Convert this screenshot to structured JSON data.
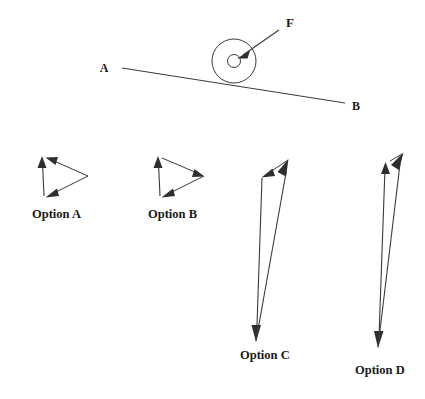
{
  "figure": {
    "title_present": false,
    "background_color": "#ffffff",
    "ink_color": "#3a3a3a",
    "arrow_fill_color": "#2e2e2e",
    "scene": {
      "name": "wheel-on-incline",
      "description": "A wheel with a central hub resting on an inclined line from A (upper left) to B (lower right), with an applied force F directed down-and-left into the hub.",
      "incline": {
        "left_point_label": "A",
        "right_point_label": "B",
        "left_end": {
          "x": 122,
          "y": 68
        },
        "right_end": {
          "x": 345,
          "y": 103
        }
      },
      "wheel": {
        "center": {
          "x": 234,
          "y": 61
        },
        "outer_radius": 22,
        "hub_radius": 6.5
      },
      "force": {
        "label": "F",
        "tail": {
          "x": 279,
          "y": 30
        },
        "tip": {
          "x": 238,
          "y": 58
        },
        "label_position": {
          "x": 285,
          "y": 27
        }
      }
    },
    "options": [
      {
        "id": "A",
        "label": "Option A",
        "label_position": {
          "x": 32,
          "y": 217
        },
        "vectors": [
          {
            "name": "vertical-up-vector",
            "tail": {
              "x": 44,
              "y": 196
            },
            "tip": {
              "x": 42,
              "y": 157
            },
            "direction": "up"
          },
          {
            "name": "top-left-pointing-vector",
            "tail": {
              "x": 88,
              "y": 176
            },
            "tip": {
              "x": 46,
              "y": 158
            },
            "direction": "left"
          },
          {
            "name": "diagonal-down-left-vector",
            "tail": {
              "x": 88,
              "y": 176
            },
            "tip": {
              "x": 46,
              "y": 197
            },
            "direction": "down-left"
          }
        ]
      },
      {
        "id": "B",
        "label": "Option B",
        "label_position": {
          "x": 148,
          "y": 217
        },
        "vectors": [
          {
            "name": "vertical-up-vector",
            "tail": {
              "x": 160,
              "y": 196
            },
            "tip": {
              "x": 158,
              "y": 157
            },
            "direction": "up"
          },
          {
            "name": "top-right-pointing-vector",
            "tail": {
              "x": 162,
              "y": 158
            },
            "tip": {
              "x": 204,
              "y": 176
            },
            "direction": "right"
          },
          {
            "name": "diagonal-down-left-vector",
            "tail": {
              "x": 204,
              "y": 176
            },
            "tip": {
              "x": 162,
              "y": 197
            },
            "direction": "down-left"
          }
        ]
      },
      {
        "id": "C",
        "label": "Option C",
        "label_position": {
          "x": 240,
          "y": 358
        },
        "vectors": [
          {
            "name": "long-down-vector",
            "tail": {
              "x": 262,
              "y": 178
            },
            "tip": {
              "x": 256,
              "y": 341
            },
            "direction": "down"
          },
          {
            "name": "long-up-vector",
            "tail": {
              "x": 256,
              "y": 341
            },
            "tip": {
              "x": 288,
              "y": 160
            },
            "direction": "up"
          },
          {
            "name": "short-down-left-vector",
            "tail": {
              "x": 288,
              "y": 160
            },
            "tip": {
              "x": 262,
              "y": 177
            },
            "direction": "down-left"
          }
        ]
      },
      {
        "id": "D",
        "label": "Option D",
        "label_position": {
          "x": 355,
          "y": 373
        },
        "vectors": [
          {
            "name": "long-down-vector",
            "tail": {
              "x": 385,
              "y": 163
            },
            "tip": {
              "x": 378,
              "y": 347
            },
            "direction": "down"
          },
          {
            "name": "long-up-right-vector",
            "tail": {
              "x": 378,
              "y": 347
            },
            "tip": {
              "x": 403,
              "y": 153
            },
            "direction": "up-right"
          },
          {
            "name": "short-down-left-vector",
            "tail": {
              "x": 403,
              "y": 153
            },
            "tip": {
              "x": 380,
              "y": 166
            },
            "direction": "down-left"
          }
        ]
      }
    ]
  }
}
